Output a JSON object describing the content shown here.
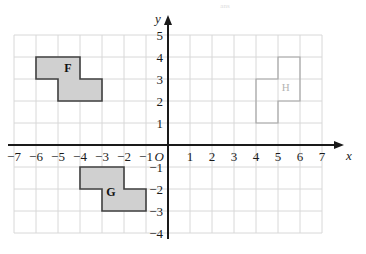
{
  "chart_data": {
    "type": "scatter",
    "title": "",
    "xlabel": "x",
    "ylabel": "y",
    "xlim": [
      -7,
      7
    ],
    "ylim": [
      -4,
      5
    ],
    "grid": true,
    "legend": "none",
    "x_ticks": [
      "-7",
      "-6",
      "-5",
      "-4",
      "-3",
      "-2",
      "-1",
      "1",
      "2",
      "3",
      "4",
      "5",
      "6",
      "7"
    ],
    "x_tick_values": [
      -7,
      -6,
      -5,
      -4,
      -3,
      -2,
      -1,
      1,
      2,
      3,
      4,
      5,
      6,
      7
    ],
    "y_ticks": [
      "5",
      "4",
      "3",
      "2",
      "1",
      "-1",
      "-2",
      "-3",
      "-4"
    ],
    "y_tick_values": [
      5,
      4,
      3,
      2,
      1,
      -1,
      -2,
      -3,
      -4
    ],
    "origin_label": "O",
    "shapes": [
      {
        "label": "F",
        "fill": "#d0d0d0",
        "stroke": "#404040",
        "label_color": "#111111",
        "filled": true,
        "label_point": [
          -4.55,
          3.45
        ],
        "vertices": [
          [
            -6,
            4
          ],
          [
            -4,
            4
          ],
          [
            -4,
            3
          ],
          [
            -3,
            3
          ],
          [
            -3,
            2
          ],
          [
            -5,
            2
          ],
          [
            -5,
            3
          ],
          [
            -6,
            3
          ]
        ]
      },
      {
        "label": "G",
        "fill": "#d0d0d0",
        "stroke": "#404040",
        "label_color": "#111111",
        "filled": true,
        "label_point": [
          -2.6,
          -2.2
        ],
        "vertices": [
          [
            -4,
            -1
          ],
          [
            -2,
            -1
          ],
          [
            -2,
            -2
          ],
          [
            -1,
            -2
          ],
          [
            -1,
            -3
          ],
          [
            -3,
            -3
          ],
          [
            -3,
            -2
          ],
          [
            -4,
            -2
          ]
        ]
      },
      {
        "label": "H",
        "fill": "none",
        "stroke": "#a8a8a8",
        "label_color": "#b4b4b4",
        "filled": false,
        "label_point": [
          5.35,
          2.55
        ],
        "vertices": [
          [
            5,
            4
          ],
          [
            6,
            4
          ],
          [
            6,
            2
          ],
          [
            5,
            2
          ],
          [
            5,
            1
          ],
          [
            4,
            1
          ],
          [
            4,
            3
          ],
          [
            5,
            3
          ]
        ]
      }
    ]
  },
  "axes": {
    "x_axis_name": "x",
    "y_axis_name": "y",
    "origin": "O"
  },
  "watermark": {
    "text": "ans"
  }
}
